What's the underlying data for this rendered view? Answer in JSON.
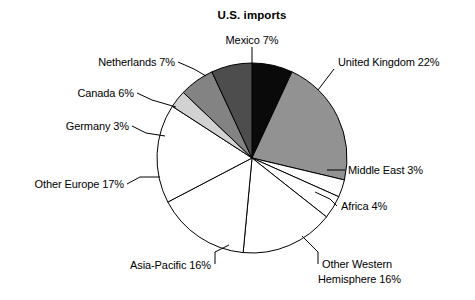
{
  "chart_data": {
    "type": "pie",
    "title": "U.S. imports",
    "xlabel": "",
    "ylabel": "",
    "legend_position": "none",
    "grid": false,
    "units": "percent",
    "start_angle_deg": 0,
    "direction": "clockwise",
    "categories": [
      "Mexico",
      "United Kingdom",
      "Middle East",
      "Africa",
      "Other Western Hemisphere",
      "Asia-Pacific",
      "Other Europe",
      "Germany",
      "Canada",
      "Netherlands"
    ],
    "values": [
      7,
      22,
      3,
      4,
      16,
      16,
      17,
      3,
      6,
      7
    ],
    "slices": [
      {
        "label": "Mexico 7%",
        "name": "Mexico",
        "value": 7,
        "value_text": "7%",
        "color": "#0a0a0a"
      },
      {
        "label": "United Kingdom 22%",
        "name": "United Kingdom",
        "value": 22,
        "value_text": "22%",
        "color": "#929292"
      },
      {
        "label": "Middle East 3%",
        "name": "Middle East",
        "value": 3,
        "value_text": "3%",
        "color": "#ffffff"
      },
      {
        "label": "Africa 4%",
        "name": "Africa",
        "value": 4,
        "value_text": "4%",
        "color": "#ffffff"
      },
      {
        "label": "Other Western",
        "label_line2": "Hemisphere 16%",
        "name": "Other Western Hemisphere",
        "value": 16,
        "value_text": "16%",
        "color": "#ffffff"
      },
      {
        "label": "Asia-Pacific 16%",
        "name": "Asia-Pacific",
        "value": 16,
        "value_text": "16%",
        "color": "#ffffff"
      },
      {
        "label": "Other Europe 17%",
        "name": "Other Europe",
        "value": 17,
        "value_text": "17%",
        "color": "#ffffff"
      },
      {
        "label": "Germany 3%",
        "name": "Germany",
        "value": 3,
        "value_text": "3%",
        "color": "#d2d2d2"
      },
      {
        "label": "Canada 6%",
        "name": "Canada",
        "value": 6,
        "value_text": "6%",
        "color": "#838383"
      },
      {
        "label": "Netherlands 7%",
        "name": "Netherlands",
        "value": 7,
        "value_text": "7%",
        "color": "#4d4d4d"
      }
    ],
    "colors": {
      "outline": "#000000",
      "background": "#ffffff",
      "text": "#000000"
    }
  }
}
